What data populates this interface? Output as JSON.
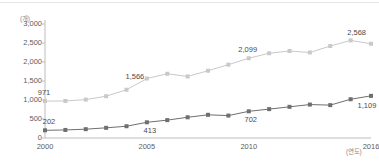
{
  "chart_data": {
    "type": "line",
    "title": "",
    "subtitle": "",
    "xlabel": "(연도)",
    "ylabel": "(개)",
    "x": [
      2000,
      2001,
      2002,
      2003,
      2004,
      2005,
      2006,
      2007,
      2008,
      2009,
      2010,
      2011,
      2012,
      2013,
      2014,
      2015,
      2016
    ],
    "categories": [
      "2000",
      "2001",
      "2002",
      "2003",
      "2004",
      "2005",
      "2006",
      "2007",
      "2008",
      "2009",
      "2010",
      "2011",
      "2012",
      "2013",
      "2014",
      "2015",
      "2016"
    ],
    "xlim": [
      2000,
      2016
    ],
    "ylim": [
      0,
      3000
    ],
    "ytick_labels": [
      "3,000",
      "2,500",
      "2,000",
      "1,500",
      "1,000",
      "500",
      "0"
    ],
    "ytick_values": [
      3000,
      2500,
      2000,
      1500,
      1000,
      500,
      0
    ],
    "xtick_labels": [
      "2000",
      "2005",
      "2010",
      "2016"
    ],
    "xtick_values": [
      2000,
      2005,
      2010,
      2016
    ],
    "grid": false,
    "legend": "none",
    "series": [
      {
        "name": "upper-series",
        "color": "#c9c9c9",
        "marker": "square",
        "values": [
          971,
          975,
          1010,
          1100,
          1270,
          1566,
          1690,
          1620,
          1770,
          1930,
          2099,
          2230,
          2290,
          2250,
          2420,
          2568,
          2480
        ],
        "point_labels": [
          {
            "index": 0,
            "text": "971"
          },
          {
            "index": 5,
            "text": "1,566"
          },
          {
            "index": 10,
            "text": "2,099"
          },
          {
            "index": 15,
            "text": "2,568"
          }
        ]
      },
      {
        "name": "lower-series",
        "color": "#6f6f6f",
        "marker": "square",
        "values": [
          202,
          212,
          232,
          268,
          310,
          413,
          470,
          545,
          610,
          590,
          702,
          760,
          820,
          880,
          865,
          1020,
          1109
        ],
        "point_labels": [
          {
            "index": 0,
            "text": "202"
          },
          {
            "index": 5,
            "text": "413"
          },
          {
            "index": 10,
            "text": "702"
          },
          {
            "index": 16,
            "text": "1,109"
          }
        ]
      }
    ],
    "data_labels": [
      "971",
      "1,566",
      "2,099",
      "2,568",
      "202",
      "413",
      "702",
      "1,109"
    ]
  }
}
